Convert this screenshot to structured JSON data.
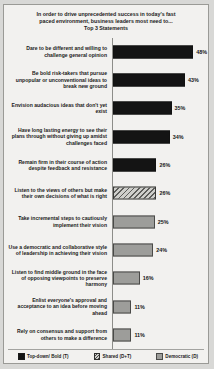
{
  "title": {
    "line1": "In order to drive unprecedented success in today's fast",
    "line2": "paced environment, business leaders most need to...",
    "line3": "Top 3 Statements"
  },
  "legend": {
    "position": "bottom",
    "items": [
      {
        "label": "Top-down/ Bold (T)",
        "style": "t",
        "color": "#141414"
      },
      {
        "label": "Shared (D+T)",
        "style": "s",
        "color": "#cfcfcb"
      },
      {
        "label": "Democratic (D)",
        "style": "d",
        "color": "#9d9d9a"
      }
    ]
  },
  "chart_data": {
    "type": "bar",
    "orientation": "horizontal",
    "title": "In order to drive unprecedented success in today's fast paced environment, business leaders most need to... Top 3 Statements",
    "xlabel": "",
    "ylabel": "",
    "xlim": [
      0,
      55
    ],
    "grid": false,
    "value_suffix": "%",
    "categories": [
      "Dare to be different and willing to challenge  general opinion",
      "Be bold risk-takers  that pursue unpopular or unconventional ideas to break new ground",
      "Envision audacious ideas that don't yet exist",
      "Have long lasting energy to see their plans through without giving up amidst challenges faced",
      "Remain firm in their course of action despite feedback and resistance",
      "Listen to the views of others but make their own decisions of what is right",
      "Take incremental steps to cautiously implement their vision",
      "Use a democratic and collaborative style of leadership  in achieving their vision",
      "Listen to find middle ground in the face of opposing viewpoints  to preserve harmony",
      "Enlist everyone's approval and acceptance to an idea before moving ahead",
      "Rely on consensus and support from others to make a difference"
    ],
    "values": [
      48,
      43,
      35,
      34,
      26,
      26,
      25,
      24,
      16,
      11,
      11
    ],
    "value_labels": [
      "48%",
      "43%",
      "35%",
      "34%",
      "26%",
      "26%",
      "25%",
      "24%",
      "16%",
      "11%",
      "11%"
    ],
    "series_styles": [
      "t",
      "t",
      "t",
      "t",
      "t",
      "s",
      "d",
      "d",
      "d",
      "d",
      "d"
    ]
  }
}
